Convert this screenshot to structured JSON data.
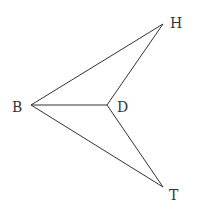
{
  "diagram": {
    "nodes": [
      {
        "id": "B",
        "label": "B"
      },
      {
        "id": "D",
        "label": "D"
      },
      {
        "id": "H",
        "label": "H"
      },
      {
        "id": "T",
        "label": "T"
      }
    ],
    "edges": [
      {
        "from": "B",
        "to": "H"
      },
      {
        "from": "B",
        "to": "D"
      },
      {
        "from": "B",
        "to": "T"
      },
      {
        "from": "D",
        "to": "H"
      },
      {
        "from": "D",
        "to": "T"
      }
    ]
  }
}
